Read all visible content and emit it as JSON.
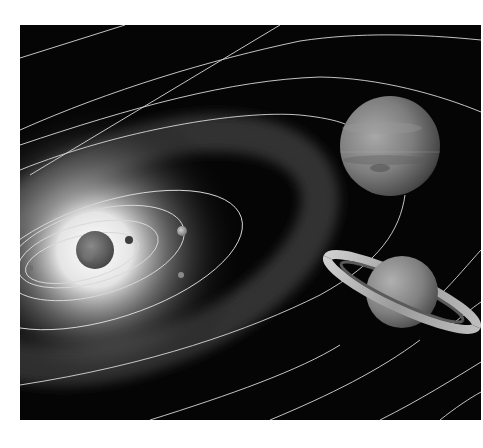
{
  "image": {
    "subject": "Illustration of the solar system",
    "background_color": "#ffffff",
    "space_color": "#050505",
    "frame": {
      "x": 20,
      "y": 25,
      "width": 461,
      "height": 395
    }
  },
  "bodies": [
    {
      "name": "Sun",
      "cx": 95,
      "cy": 250,
      "r": 19,
      "color": "#6e6e6e"
    },
    {
      "name": "Mercury",
      "cx": 30,
      "cy": 268,
      "r": 3,
      "color": "#7a7a7a"
    },
    {
      "name": "Venus",
      "cx": 129,
      "cy": 240,
      "r": 4,
      "color": "#3e3e3e"
    },
    {
      "name": "Earth",
      "cx": 182,
      "cy": 231,
      "r": 5,
      "color": "#9a9a9a"
    },
    {
      "name": "Mars",
      "cx": 181,
      "cy": 275,
      "r": 3,
      "color": "#8a8a8a"
    },
    {
      "name": "Jupiter",
      "cx": 390,
      "cy": 146,
      "r": 50,
      "color": "#8c8c8c"
    },
    {
      "name": "Saturn",
      "cx": 402,
      "cy": 292,
      "r": 36,
      "color": "#8a8a8a"
    }
  ],
  "orbit_color": "#d8d8d8",
  "asteroid_belt_color": "#3a3a3a"
}
